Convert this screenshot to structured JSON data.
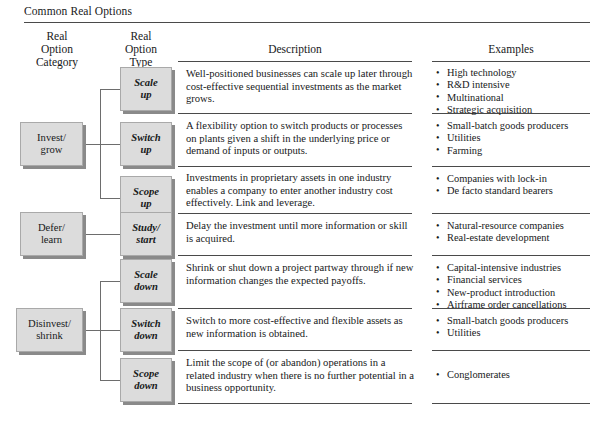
{
  "figure": {
    "title": "Common Real Options",
    "caption": "",
    "headers": {
      "category": "Real\nOption\nCategory",
      "type": "Real\nOption\nType",
      "description": "Description",
      "examples": "Examples"
    },
    "categories": [
      {
        "id": "invest-grow",
        "label": "Invest/\ngrow"
      },
      {
        "id": "defer-learn",
        "label": "Defer/\nlearn"
      },
      {
        "id": "disinvest-shrink",
        "label": "Disinvest/\nshrink"
      }
    ],
    "rows": [
      {
        "type": "Scale\nup",
        "description": "Well-positioned businesses can scale up later through cost-effective sequential investments as the market grows.",
        "examples": [
          "High technology",
          "R&D intensive",
          "Multinational",
          "Strategic acquisition"
        ]
      },
      {
        "type": "Switch\nup",
        "description": "A flexibility option to switch products or processes on plants given a shift in the underlying price or demand of inputs or outputs.",
        "examples": [
          "Small-batch goods producers",
          "Utilities",
          "Farming"
        ]
      },
      {
        "type": "Scope\nup",
        "description": "Investments in proprietary assets in one industry enables a company to enter another industry cost effectively. Link and leverage.",
        "examples": [
          "Companies with lock-in",
          "De facto standard bearers"
        ]
      },
      {
        "type": "Study/\nstart",
        "description": "Delay the investment until more information or skill is acquired.",
        "examples": [
          "Natural-resource companies",
          "Real-estate development"
        ]
      },
      {
        "type": "Scale\ndown",
        "description": "Shrink or shut down a project partway through if new information changes the expected payoffs.",
        "examples": [
          "Capital-intensive industries",
          "Financial services",
          "New-product introduction",
          "Airframe order cancellations"
        ]
      },
      {
        "type": "Switch\ndown",
        "description": "Switch to more cost-effective and flexible assets as new information is obtained.",
        "examples": [
          "Small-batch goods producers",
          "Utilities"
        ]
      },
      {
        "type": "Scope\ndown",
        "description": "Limit the scope of (or abandon) operations in a related industry when there is no further potential in a business opportunity.",
        "examples": [
          "Conglomerates"
        ]
      }
    ],
    "colors": {
      "box_fill": "#dcdcdc",
      "box_border": "#a9a9a9",
      "box_shadow": "#8a8a8a",
      "rule": "#4a4a4a",
      "connector": "#6d6d6d",
      "text": "#17191a"
    }
  }
}
